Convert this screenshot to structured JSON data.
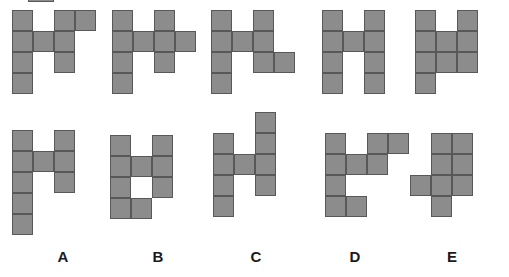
{
  "page": {
    "background_color": "#ffffff",
    "cell_fill_color": "#8c8c8c",
    "cell_stroke_color": "#585858",
    "label_color": "#1a1a1a",
    "cell_size_px": 21,
    "width_px": 509,
    "height_px": 277
  },
  "labels": [
    {
      "text": "A",
      "x": 48,
      "y": 248
    },
    {
      "text": "B",
      "x": 143,
      "y": 248
    },
    {
      "text": "C",
      "x": 241,
      "y": 248
    },
    {
      "text": "D",
      "x": 340,
      "y": 248
    },
    {
      "text": "E",
      "x": 437,
      "y": 248
    }
  ],
  "shapes": [
    {
      "name": "shape-top-a",
      "row": "top",
      "column_label": "A",
      "origin": {
        "x": 12,
        "y": 10
      },
      "cols": 4,
      "rows": 4,
      "cell_count": 9,
      "grid": [
        [
          1,
          0,
          1,
          1
        ],
        [
          1,
          1,
          1,
          0
        ],
        [
          1,
          0,
          1,
          0
        ],
        [
          1,
          0,
          0,
          0
        ]
      ]
    },
    {
      "name": "shape-top-b",
      "row": "top",
      "column_label": "B",
      "origin": {
        "x": 112,
        "y": 10
      },
      "cols": 4,
      "rows": 4,
      "cell_count": 9,
      "grid": [
        [
          1,
          0,
          1,
          0
        ],
        [
          1,
          1,
          1,
          1
        ],
        [
          1,
          0,
          1,
          0
        ],
        [
          1,
          0,
          0,
          0
        ]
      ]
    },
    {
      "name": "shape-top-c",
      "row": "top",
      "column_label": "C",
      "origin": {
        "x": 211,
        "y": 10
      },
      "cols": 4,
      "rows": 4,
      "cell_count": 9,
      "grid": [
        [
          1,
          0,
          1,
          0
        ],
        [
          1,
          1,
          1,
          0
        ],
        [
          1,
          0,
          1,
          1
        ],
        [
          1,
          0,
          0,
          0
        ]
      ]
    },
    {
      "name": "shape-top-d",
      "row": "top",
      "column_label": "D",
      "origin": {
        "x": 322,
        "y": 10
      },
      "cols": 3,
      "rows": 4,
      "cell_count": 9,
      "grid": [
        [
          1,
          0,
          1
        ],
        [
          1,
          1,
          1
        ],
        [
          1,
          0,
          1
        ],
        [
          1,
          0,
          1
        ]
      ]
    },
    {
      "name": "shape-top-e",
      "row": "top",
      "column_label": "E",
      "origin": {
        "x": 415,
        "y": 10
      },
      "cols": 3,
      "rows": 4,
      "cell_count": 9,
      "grid": [
        [
          1,
          0,
          1
        ],
        [
          1,
          1,
          1
        ],
        [
          1,
          1,
          1
        ],
        [
          1,
          0,
          0
        ]
      ]
    },
    {
      "name": "shape-bottom-a",
      "row": "bottom",
      "column_label": "A",
      "origin": {
        "x": 12,
        "y": 130
      },
      "cols": 3,
      "rows": 5,
      "cell_count": 9,
      "grid": [
        [
          1,
          0,
          1
        ],
        [
          1,
          1,
          1
        ],
        [
          1,
          0,
          1
        ],
        [
          1,
          0,
          0
        ],
        [
          1,
          0,
          0
        ]
      ]
    },
    {
      "name": "shape-bottom-b",
      "row": "bottom",
      "column_label": "B",
      "origin": {
        "x": 110,
        "y": 135
      },
      "cols": 3,
      "rows": 4,
      "cell_count": 9,
      "grid": [
        [
          1,
          0,
          1
        ],
        [
          1,
          1,
          1
        ],
        [
          1,
          0,
          1
        ],
        [
          1,
          1,
          0
        ]
      ]
    },
    {
      "name": "shape-bottom-c",
      "row": "bottom",
      "column_label": "C",
      "origin": {
        "x": 213,
        "y": 112
      },
      "cols": 3,
      "rows": 5,
      "cell_count": 9,
      "grid": [
        [
          0,
          0,
          1
        ],
        [
          1,
          0,
          1
        ],
        [
          1,
          1,
          1
        ],
        [
          1,
          0,
          1
        ],
        [
          1,
          0,
          0
        ]
      ]
    },
    {
      "name": "shape-bottom-d",
      "row": "bottom",
      "column_label": "D",
      "origin": {
        "x": 325,
        "y": 133
      },
      "cols": 4,
      "rows": 4,
      "cell_count": 9,
      "grid": [
        [
          1,
          0,
          1,
          1
        ],
        [
          1,
          1,
          1,
          0
        ],
        [
          1,
          0,
          0,
          0
        ],
        [
          1,
          1,
          0,
          0
        ]
      ]
    },
    {
      "name": "shape-bottom-e",
      "row": "bottom",
      "column_label": "E",
      "origin": {
        "x": 410,
        "y": 133
      },
      "cols": 3,
      "rows": 4,
      "cell_count": 9,
      "grid": [
        [
          0,
          1,
          1
        ],
        [
          0,
          1,
          1
        ],
        [
          1,
          1,
          1
        ],
        [
          0,
          1,
          0
        ]
      ]
    }
  ]
}
